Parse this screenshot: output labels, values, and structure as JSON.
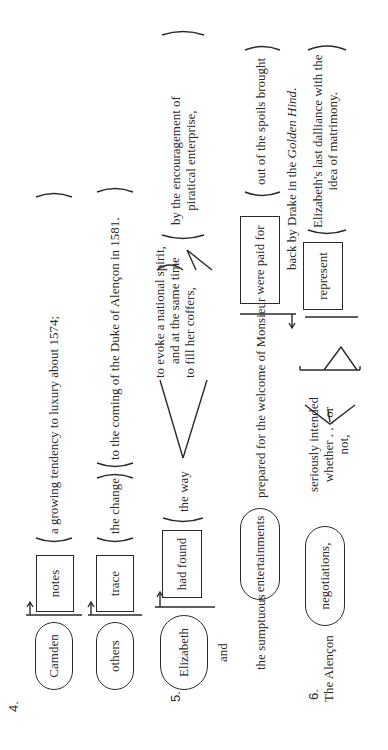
{
  "diagram": {
    "orientation": "rotated-90-ccw",
    "s4": {
      "number": "4.",
      "row1": {
        "subject": "Camden",
        "verb": "notes",
        "object": "a growing tendency to luxury about 1574;"
      },
      "row2": {
        "subject": "others",
        "verb": "trace",
        "object": "the change",
        "modifier": "to the coming of the Duke of Alençon in 1581."
      }
    },
    "s5": {
      "number": "5.",
      "subject": "Elizabeth",
      "conjunction": "and",
      "verb": "had found",
      "object": "the way",
      "branch_line1": "to evoke a national spirit,",
      "branch_line2": "and at the same time",
      "branch_line3": "to fill her coffers,",
      "means_line1": "by the encouragement of",
      "means_line2": "piratical enterprise,",
      "row2_prefix": "the sumptuous",
      "row2_subject": "entertainments",
      "row2_modifier": "prepared for the welcome of Monsieur",
      "row2_verb": "were paid for",
      "row2_source_line1": "out of the spoils brought",
      "row2_source_line2": "back by Drake in the",
      "row2_source_italic": "Golden Hind",
      "row2_source_end": "."
    },
    "s6": {
      "number": "6.",
      "prefix": "The Alençon",
      "subject": "negotiations,",
      "bracket_line1": "seriously intended",
      "bracket_line2": "whether . . . or",
      "bracket_line3": "not,",
      "verb": "represent",
      "object_line1": "Elizabeth's last dalliance with the",
      "object_line2": "idea of matrimony."
    }
  }
}
